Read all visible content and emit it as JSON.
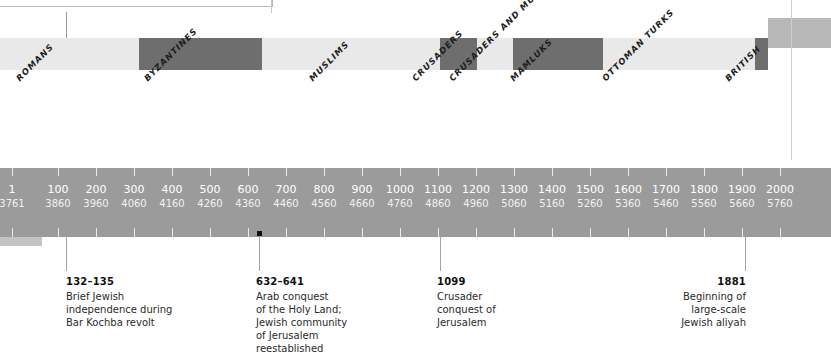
{
  "figure": {
    "type": "historical-timeline",
    "bar_color": "#9b9b9b",
    "era_band_light": "#e9e9e9",
    "era_band_dark": "#6e6e6e",
    "modern_box_color": "#b7b7b7"
  },
  "eras": [
    {
      "label": "ROMANS",
      "tone": "light",
      "x": 0,
      "w": 139,
      "label_x": 14,
      "label_y": 76
    },
    {
      "label": "BYZANTINES",
      "tone": "dark",
      "x": 139,
      "w": 123,
      "label_x": 142,
      "label_y": 76
    },
    {
      "label": "MUSLIMS",
      "tone": "light",
      "x": 262,
      "w": 178,
      "label_x": 307,
      "label_y": 76
    },
    {
      "label": "CRUSADERS",
      "tone": "dark",
      "x": 440,
      "w": 37,
      "label_x": 410,
      "label_y": 76
    },
    {
      "label": "CRUSADERS\nAND MUSLIMS",
      "tone": "light",
      "x": 477,
      "w": 36,
      "label_x": 447,
      "label_y": 76
    },
    {
      "label": "MAMLUKS",
      "tone": "dark",
      "x": 513,
      "w": 90,
      "label_x": 508,
      "label_y": 76
    },
    {
      "label": "OTTOMAN TURKS",
      "tone": "light",
      "x": 603,
      "w": 152,
      "label_x": 600,
      "label_y": 76
    },
    {
      "label": "BRITISH",
      "tone": "dark",
      "x": 755,
      "w": 13,
      "label_x": 723,
      "label_y": 76
    }
  ],
  "ticks": [
    {
      "gregorian": "1",
      "hebrew": "3761",
      "x": 12
    },
    {
      "gregorian": "100",
      "hebrew": "3860",
      "x": 58
    },
    {
      "gregorian": "200",
      "hebrew": "3960",
      "x": 96
    },
    {
      "gregorian": "300",
      "hebrew": "4060",
      "x": 134
    },
    {
      "gregorian": "400",
      "hebrew": "4160",
      "x": 172
    },
    {
      "gregorian": "500",
      "hebrew": "4260",
      "x": 210
    },
    {
      "gregorian": "600",
      "hebrew": "4360",
      "x": 248
    },
    {
      "gregorian": "700",
      "hebrew": "4460",
      "x": 286
    },
    {
      "gregorian": "800",
      "hebrew": "4560",
      "x": 324
    },
    {
      "gregorian": "900",
      "hebrew": "4660",
      "x": 362
    },
    {
      "gregorian": "1000",
      "hebrew": "4760",
      "x": 400
    },
    {
      "gregorian": "1100",
      "hebrew": "4860",
      "x": 438
    },
    {
      "gregorian": "1200",
      "hebrew": "4960",
      "x": 476
    },
    {
      "gregorian": "1300",
      "hebrew": "5060",
      "x": 514
    },
    {
      "gregorian": "1400",
      "hebrew": "5160",
      "x": 552
    },
    {
      "gregorian": "1500",
      "hebrew": "5260",
      "x": 590
    },
    {
      "gregorian": "1600",
      "hebrew": "5360",
      "x": 628
    },
    {
      "gregorian": "1700",
      "hebrew": "5460",
      "x": 666
    },
    {
      "gregorian": "1800",
      "hebrew": "5560",
      "x": 704
    },
    {
      "gregorian": "1900",
      "hebrew": "5660",
      "x": 742
    },
    {
      "gregorian": "2000",
      "hebrew": "5760",
      "x": 780
    }
  ],
  "annotations": [
    {
      "year": "132–135",
      "text": "Brief Jewish\nindependence during\nBar Kochba revolt",
      "line_x": 66,
      "box_x": 66,
      "box_y": 275,
      "align": "left",
      "marker": false
    },
    {
      "year": "632–641",
      "text": "Arab conquest\nof the Holy Land;\nJewish community\nof Jerusalem\nreestablished",
      "line_x": 259,
      "box_x": 256,
      "box_y": 275,
      "align": "left",
      "marker": true
    },
    {
      "year": "1099",
      "text": "Crusader\nconquest of\nJerusalem",
      "line_x": 440,
      "box_x": 437,
      "box_y": 275,
      "align": "left",
      "marker": false
    },
    {
      "year": "1881",
      "text": "Beginning of\nlarge-scale\nJewish aliyah",
      "line_x": 745,
      "box_x": 0,
      "box_y": 275,
      "align": "right",
      "marker": false
    }
  ]
}
